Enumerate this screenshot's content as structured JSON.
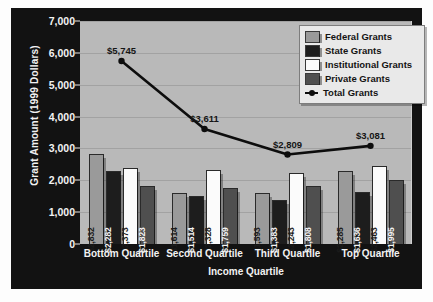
{
  "chart_data": {
    "type": "bar",
    "title": "",
    "xlabel": "Income Quartile",
    "ylabel": "Grant Amount (1999 Dollars)",
    "ylim": [
      0,
      7000
    ],
    "yticks": [
      "0",
      "1,000",
      "2,000",
      "3,000",
      "4,000",
      "5,000",
      "6,000",
      "7,000"
    ],
    "ytick_values": [
      0,
      1000,
      2000,
      3000,
      4000,
      5000,
      6000,
      7000
    ],
    "grid": true,
    "legend_position": "top-right",
    "categories": [
      "Bottom Quartile",
      "Second Quartile",
      "Third Quartile",
      "Top Quartile"
    ],
    "series": [
      {
        "name": "Federal Grants",
        "type": "bar",
        "color": "#9a9a9a",
        "values": [
          2832,
          1614,
          1593,
          2285
        ],
        "labels": [
          "$2,832",
          "$1,614",
          "$1,593",
          "$2,285"
        ],
        "label_tone": "dark"
      },
      {
        "name": "State Grants",
        "type": "bar",
        "color": "#1d1d1d",
        "values": [
          2282,
          1514,
          1383,
          1636
        ],
        "labels": [
          "$2,282",
          "$1,514",
          "$1,383",
          "$1,636"
        ],
        "label_tone": "light"
      },
      {
        "name": "Institutional Grants",
        "type": "bar",
        "color": "#fbfbfb",
        "values": [
          2373,
          2328,
          2243,
          2463
        ],
        "labels": [
          "$2,373",
          "$2,328",
          "$2,243",
          "$2,463"
        ],
        "label_tone": "dark"
      },
      {
        "name": "Private Grants",
        "type": "bar",
        "color": "#4f4f4f",
        "values": [
          1823,
          1759,
          1808,
          1995
        ],
        "labels": [
          "$1,823",
          "$1,759",
          "$1,808",
          "$1,995"
        ],
        "label_tone": "light"
      },
      {
        "name": "Total Grants",
        "type": "line",
        "color": "#0d0d0d",
        "values": [
          5745,
          3611,
          2809,
          3081
        ],
        "labels": [
          "$5,745",
          "$3,611",
          "$2,809",
          "$3,081"
        ]
      }
    ]
  },
  "legend": {
    "items": [
      {
        "label": "Federal Grants",
        "marker": "swatch",
        "color": "#9a9a9a"
      },
      {
        "label": "State Grants",
        "marker": "swatch",
        "color": "#1d1d1d"
      },
      {
        "label": "Institutional Grants",
        "marker": "swatch",
        "color": "#fbfbfb"
      },
      {
        "label": "Private Grants",
        "marker": "swatch",
        "color": "#4f4f4f"
      },
      {
        "label": "Total Grants",
        "marker": "line",
        "color": "#0d0d0d"
      }
    ]
  },
  "caption": ""
}
